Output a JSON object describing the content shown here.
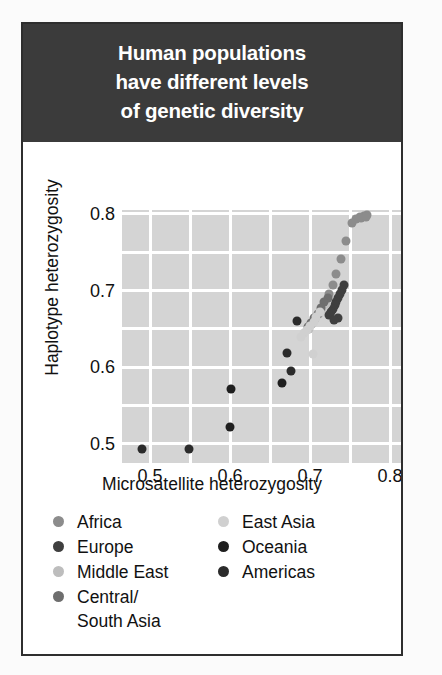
{
  "figure": {
    "title_lines": [
      "Human populations",
      "have different levels",
      "of genetic diversity"
    ],
    "banner_color": "#3b3b3b",
    "border_color": "#2e2e2e",
    "panel_color": "#d4d4d4",
    "grid_color": "#ffffff"
  },
  "legend": {
    "left_column": [
      {
        "label": "Africa",
        "color": "#8c8c8c"
      },
      {
        "label": "Europe",
        "color": "#3f3f3f"
      },
      {
        "label": "Middle East",
        "color": "#bdbdbd"
      },
      {
        "label": "Central/\nSouth Asia",
        "color": "#6e6e6e"
      }
    ],
    "right_column": [
      {
        "label": "East Asia",
        "color": "#d0d0d0"
      },
      {
        "label": "Oceania",
        "color": "#1f1f1f"
      },
      {
        "label": "Americas",
        "color": "#2b2b2b"
      }
    ]
  },
  "chart_data": {
    "type": "scatter",
    "title": "Human populations have different levels of genetic diversity",
    "xlabel": "Microsatellite heterozygosity",
    "ylabel": "Haplotype heterozygosity",
    "xlim": [
      0.465,
      0.815
    ],
    "ylim": [
      0.475,
      0.805
    ],
    "xticks": [
      0.5,
      0.6,
      0.7,
      0.8
    ],
    "yticks": [
      0.5,
      0.6,
      0.7,
      0.8
    ],
    "xtick_labels": [
      "0.5",
      "0.6",
      "0.7",
      "0.8"
    ],
    "ytick_labels": [
      "0.5",
      "0.6",
      "0.7",
      "0.8"
    ],
    "grid": true,
    "grid_x_step": 0.05,
    "grid_y_step": 0.05,
    "legend_position": "below-plot",
    "marker_size_px": 9,
    "series": [
      {
        "name": "Africa",
        "color": "#8c8c8c",
        "points": [
          [
            0.762,
            0.796
          ],
          [
            0.768,
            0.7975
          ],
          [
            0.7715,
            0.798
          ],
          [
            0.757,
            0.793
          ],
          [
            0.764,
            0.7945
          ],
          [
            0.77,
            0.7955
          ],
          [
            0.752,
            0.788
          ],
          [
            0.7455,
            0.764
          ],
          [
            0.739,
            0.7415
          ],
          [
            0.733,
            0.7215
          ],
          [
            0.7285,
            0.7075
          ],
          [
            0.724,
            0.696
          ]
        ]
      },
      {
        "name": "Europe",
        "color": "#3f3f3f",
        "points": [
          [
            0.743,
            0.707
          ],
          [
            0.7405,
            0.701
          ],
          [
            0.738,
            0.6955
          ],
          [
            0.7355,
            0.69
          ],
          [
            0.733,
            0.6855
          ],
          [
            0.731,
            0.681
          ],
          [
            0.7285,
            0.676
          ],
          [
            0.7265,
            0.6715
          ],
          [
            0.724,
            0.668
          ],
          [
            0.7355,
            0.664
          ],
          [
            0.73,
            0.662
          ]
        ]
      },
      {
        "name": "Middle East",
        "color": "#bdbdbd",
        "points": [
          [
            0.7195,
            0.683
          ],
          [
            0.715,
            0.6755
          ],
          [
            0.711,
            0.669
          ],
          [
            0.7065,
            0.663
          ],
          [
            0.703,
            0.656
          ],
          [
            0.699,
            0.6495
          ]
        ]
      },
      {
        "name": "Central/South Asia",
        "color": "#6e6e6e",
        "points": [
          [
            0.7225,
            0.69
          ],
          [
            0.718,
            0.6845
          ],
          [
            0.714,
            0.6775
          ],
          [
            0.7095,
            0.67
          ],
          [
            0.7055,
            0.664
          ],
          [
            0.7015,
            0.6575
          ],
          [
            0.6975,
            0.652
          ]
        ]
      },
      {
        "name": "East Asia",
        "color": "#d0d0d0",
        "points": [
          [
            0.712,
            0.672
          ],
          [
            0.708,
            0.6655
          ],
          [
            0.7045,
            0.6595
          ],
          [
            0.7005,
            0.654
          ],
          [
            0.6965,
            0.648
          ],
          [
            0.693,
            0.644
          ],
          [
            0.689,
            0.64
          ],
          [
            0.704,
            0.6175
          ]
        ]
      },
      {
        "name": "Oceania",
        "color": "#1f1f1f",
        "points": [
          [
            0.6,
            0.522
          ],
          [
            0.601,
            0.5715
          ],
          [
            0.6655,
            0.58
          ]
        ]
      },
      {
        "name": "Americas",
        "color": "#2b2b2b",
        "points": [
          [
            0.49,
            0.4935
          ],
          [
            0.549,
            0.4935
          ],
          [
            0.676,
            0.5945
          ],
          [
            0.6715,
            0.619
          ],
          [
            0.684,
            0.6605
          ]
        ]
      }
    ]
  }
}
